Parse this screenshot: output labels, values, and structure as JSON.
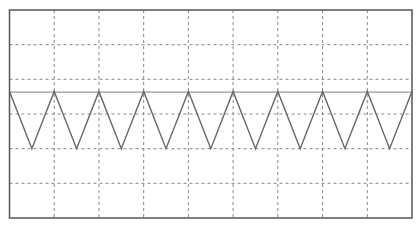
{
  "chart_data": {
    "type": "line",
    "title": "",
    "xlabel": "",
    "ylabel": "",
    "grid": true,
    "grid_style": "dashed",
    "grid_divisions": {
      "x": 9,
      "y": 6
    },
    "xlim": [
      0,
      9
    ],
    "ylim": [
      -3,
      3
    ],
    "center_line_y": 0.63,
    "series": [
      {
        "name": "triangle-wave",
        "waveform": "triangle",
        "period_divisions": 1,
        "x": [
          0,
          0.5,
          1,
          1.5,
          2,
          2.5,
          3,
          3.5,
          4,
          4.5,
          5,
          5.5,
          6,
          6.5,
          7,
          7.5,
          8,
          8.5,
          9
        ],
        "y": [
          0.65,
          -1.0,
          0.65,
          -1.0,
          0.65,
          -1.0,
          0.65,
          -1.0,
          0.65,
          -1.0,
          0.65,
          -1.0,
          0.65,
          -1.0,
          0.65,
          -1.0,
          0.65,
          -1.0,
          0.65
        ]
      }
    ]
  },
  "colors": {
    "frame": "#555555",
    "grid": "#888888",
    "trace": "#666666",
    "center_line": "#999999",
    "background": "#ffffff"
  }
}
